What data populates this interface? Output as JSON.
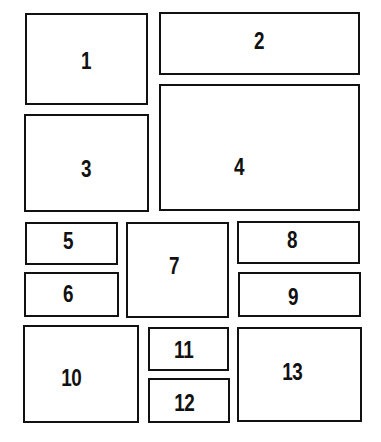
{
  "diagram": {
    "type": "numbered panel layout",
    "stroke_color": "#111111",
    "background_color": "#ffffff",
    "panels": [
      {
        "label": "1",
        "x": 25,
        "y": 13,
        "w": 123,
        "h": 92
      },
      {
        "label": "2",
        "x": 159,
        "y": 12,
        "w": 201,
        "h": 63
      },
      {
        "label": "3",
        "x": 24,
        "y": 114,
        "w": 125,
        "h": 98
      },
      {
        "label": "4",
        "x": 159,
        "y": 84,
        "w": 201,
        "h": 127
      },
      {
        "label": "5",
        "x": 25,
        "y": 222,
        "w": 93,
        "h": 43
      },
      {
        "label": "6",
        "x": 24,
        "y": 272,
        "w": 95,
        "h": 45
      },
      {
        "label": "7",
        "x": 126,
        "y": 222,
        "w": 103,
        "h": 96
      },
      {
        "label": "8",
        "x": 237,
        "y": 221,
        "w": 123,
        "h": 43
      },
      {
        "label": "9",
        "x": 238,
        "y": 272,
        "w": 123,
        "h": 45
      },
      {
        "label": "10",
        "x": 23,
        "y": 325,
        "w": 116,
        "h": 98
      },
      {
        "label": "11",
        "x": 148,
        "y": 327,
        "w": 81,
        "h": 44
      },
      {
        "label": "12",
        "x": 148,
        "y": 378,
        "w": 82,
        "h": 45
      },
      {
        "label": "13",
        "x": 237,
        "y": 327,
        "w": 125,
        "h": 95
      }
    ]
  }
}
